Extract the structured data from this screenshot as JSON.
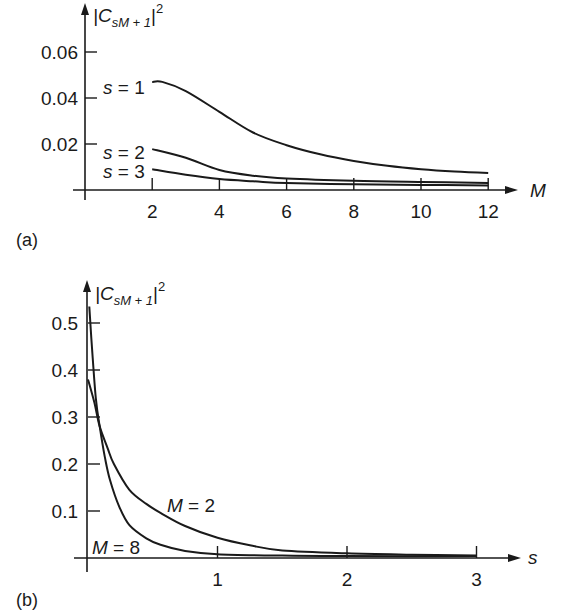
{
  "chart_data": [
    {
      "panel": "(a)",
      "type": "line",
      "title": "",
      "xlabel": "M",
      "ylabel": "|C_{sM+1}|^2",
      "ylabel_main": "|C",
      "ylabel_sub": "sM + 1",
      "ylabel_close": "|",
      "ylabel_sup": "2",
      "xlim": [
        0,
        13
      ],
      "ylim": [
        0,
        0.07
      ],
      "x_ticks": [
        2,
        4,
        6,
        8,
        10,
        12
      ],
      "x_tick_labels": [
        "2",
        "4",
        "6",
        "8",
        "10",
        "12"
      ],
      "y_ticks": [
        0.02,
        0.04,
        0.06
      ],
      "y_tick_labels": [
        "0.02",
        "0.04",
        "0.06"
      ],
      "grid": false,
      "legend": "inline labels at left of curves",
      "series": [
        {
          "name": "s = 1",
          "label_s": "s",
          "label_eq": " = 1",
          "x": [
            2,
            2.3,
            3,
            4,
            5,
            6,
            7,
            8,
            9,
            10,
            11,
            12
          ],
          "values": [
            0.047,
            0.047,
            0.043,
            0.034,
            0.025,
            0.0195,
            0.0155,
            0.0126,
            0.0105,
            0.009,
            0.008,
            0.0074
          ]
        },
        {
          "name": "s = 2",
          "label_s": "s",
          "label_eq": " = 2",
          "x": [
            2,
            3,
            4,
            5,
            6,
            8,
            10,
            12
          ],
          "values": [
            0.0178,
            0.014,
            0.0087,
            0.0062,
            0.005,
            0.004,
            0.0035,
            0.003
          ]
        },
        {
          "name": "s = 3",
          "label_s": "s",
          "label_eq": " = 3",
          "x": [
            2,
            3,
            4,
            5,
            6,
            8,
            10,
            12
          ],
          "values": [
            0.009,
            0.0066,
            0.0048,
            0.0038,
            0.003,
            0.0025,
            0.0022,
            0.002
          ]
        }
      ]
    },
    {
      "panel": "(b)",
      "type": "line",
      "title": "",
      "xlabel": "s",
      "ylabel": "|C_{sM+1}|^2",
      "ylabel_main": "|C",
      "ylabel_sub": "sM + 1",
      "ylabel_close": "|",
      "ylabel_sup": "2",
      "xlim": [
        0,
        3.3
      ],
      "ylim": [
        0,
        0.55
      ],
      "x_ticks": [
        1,
        2,
        3
      ],
      "x_tick_labels": [
        "1",
        "2",
        "3"
      ],
      "y_ticks": [
        0.1,
        0.2,
        0.3,
        0.4,
        0.5
      ],
      "y_tick_labels": [
        "0.1",
        "0.2",
        "0.3",
        "0.4",
        "0.5"
      ],
      "grid": false,
      "legend": "inline labels near curves",
      "series": [
        {
          "name": "M = 2",
          "label_m": "M",
          "label_eq": " = 2",
          "x": [
            0,
            0.05,
            0.09,
            0.15,
            0.2,
            0.32,
            0.45,
            0.56,
            0.75,
            1.0,
            1.25,
            1.5,
            2.0,
            2.5,
            3.0
          ],
          "values": [
            0.38,
            0.33,
            0.28,
            0.235,
            0.2,
            0.145,
            0.115,
            0.096,
            0.068,
            0.043,
            0.027,
            0.016,
            0.01,
            0.007,
            0.005
          ]
        },
        {
          "name": "M = 8",
          "label_m": "M",
          "label_eq": " = 8",
          "x": [
            0.01,
            0.03,
            0.06,
            0.09,
            0.13,
            0.17,
            0.24,
            0.32,
            0.45,
            0.56,
            0.75,
            1.0,
            1.5,
            2.0,
            3.0
          ],
          "values": [
            0.535,
            0.45,
            0.34,
            0.28,
            0.215,
            0.166,
            0.11,
            0.07,
            0.042,
            0.028,
            0.015,
            0.008,
            0.005,
            0.004,
            0.004
          ]
        }
      ]
    }
  ],
  "panels": {
    "a": {
      "label": "(a)"
    },
    "b": {
      "label": "(b)"
    }
  },
  "colors": {
    "ink": "#1a1a1a",
    "background": "#ffffff"
  }
}
